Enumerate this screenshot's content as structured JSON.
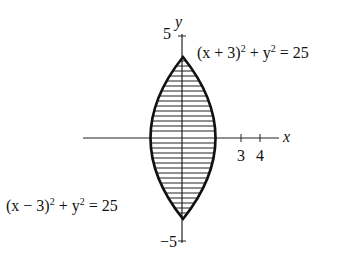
{
  "figure": {
    "type": "region between two circles (lens)",
    "axes": {
      "x_label": "x",
      "y_label": "y"
    },
    "y_ticks": [
      {
        "value": 5,
        "label": "5"
      },
      {
        "value": -5,
        "label": "−5"
      }
    ],
    "x_ticks": [
      {
        "value": 3,
        "label": "3"
      },
      {
        "value": 4,
        "label": "4"
      }
    ],
    "curves": [
      {
        "name": "right-boundary",
        "equation_lhs": "(x + 3)",
        "equation_mid": " + y",
        "equation_rhs": " = 25"
      },
      {
        "name": "left-boundary",
        "equation_lhs": "(x − 3)",
        "equation_mid": " + y",
        "equation_rhs": " = 25"
      }
    ],
    "shading": "horizontal hatching"
  }
}
